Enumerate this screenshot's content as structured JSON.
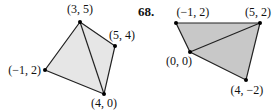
{
  "figures": [
    {
      "number": "",
      "fill": "#e6e6e6",
      "points": [
        {
          "label": "(3, 5)",
          "x": 80,
          "y": 22,
          "lx": 80,
          "ly": 13,
          "anchor": "middle"
        },
        {
          "label": "(5, 4)",
          "x": 115,
          "y": 46,
          "lx": 109,
          "ly": 39,
          "anchor": "start"
        },
        {
          "label": "(−1, 2)",
          "x": 45,
          "y": 70,
          "lx": 41,
          "ly": 74,
          "anchor": "end"
        },
        {
          "label": "(4, 0)",
          "x": 104,
          "y": 94,
          "lx": 104,
          "ly": 107,
          "anchor": "middle"
        }
      ],
      "polygon": [
        [
          80,
          22
        ],
        [
          115,
          46
        ],
        [
          104,
          94
        ],
        [
          45,
          70
        ]
      ],
      "diagonal": [
        [
          80,
          22
        ],
        [
          104,
          94
        ]
      ]
    },
    {
      "number": "68.",
      "fill": "#c8c8c8",
      "points": [
        {
          "label": "(−1, 2)",
          "x": 176,
          "y": 23,
          "lx": 193,
          "ly": 16,
          "anchor": "middle"
        },
        {
          "label": "(5, 2)",
          "x": 260,
          "y": 23,
          "lx": 258,
          "ly": 16,
          "anchor": "middle"
        },
        {
          "label": "(0, 0)",
          "x": 190,
          "y": 52,
          "lx": 179,
          "ly": 65,
          "anchor": "middle"
        },
        {
          "label": "(4, −2)",
          "x": 246,
          "y": 80,
          "lx": 247,
          "ly": 94,
          "anchor": "middle"
        }
      ],
      "polygon": [
        [
          176,
          23
        ],
        [
          260,
          23
        ],
        [
          246,
          80
        ],
        [
          190,
          52
        ]
      ],
      "diagonal": [
        [
          190,
          52
        ],
        [
          260,
          23
        ]
      ]
    }
  ],
  "problem_number": "68."
}
